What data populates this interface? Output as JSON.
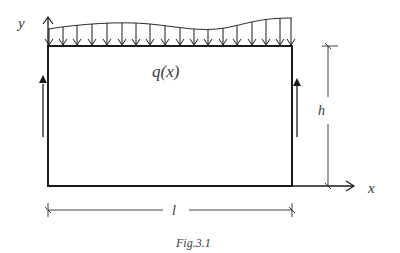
{
  "figure": {
    "caption": "Fig.3.1",
    "labels": {
      "y_axis": "y",
      "x_axis": "x",
      "load": "q(x)",
      "height": "h",
      "length": "l"
    },
    "colors": {
      "line": "#1a1a1a",
      "text": "#3a3a3a",
      "background": "#ffffff"
    },
    "geometry": {
      "rect": {
        "left": 48,
        "top": 46,
        "right": 292,
        "bottom": 186
      },
      "load_arrow_x": [
        49,
        63,
        77,
        92,
        107,
        122,
        136,
        150,
        165,
        180,
        194,
        208,
        223,
        237,
        252,
        266,
        280,
        291
      ],
      "load_curve_path": "M48,29 C80,24 120,21 150,24 C180,27 200,32 225,28 C250,23 260,18 292,18"
    }
  }
}
